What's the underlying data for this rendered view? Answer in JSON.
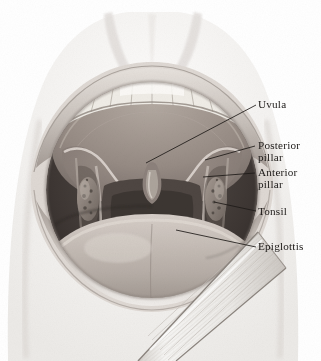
{
  "figure": {
    "type": "anatomical-illustration",
    "style": "grayscale pencil and stipple drawing",
    "background_color": "#ffffff",
    "ink_color": "#1d1a18"
  },
  "labels": [
    {
      "id": "uvula",
      "text": "Uvula",
      "line2": "",
      "x": 258,
      "y": 98,
      "leader": {
        "x1": 256,
        "y1": 105,
        "x2": 146,
        "y2": 163
      }
    },
    {
      "id": "posterior-pillar",
      "text": "Posterior",
      "line2": "pillar",
      "x": 258,
      "y": 139,
      "leader": {
        "x1": 255,
        "y1": 146,
        "x2": 205,
        "y2": 160
      }
    },
    {
      "id": "anterior-pillar",
      "text": "Anterior",
      "line2": "pillar",
      "x": 258,
      "y": 166,
      "leader": {
        "x1": 255,
        "y1": 173,
        "x2": 203,
        "y2": 177
      }
    },
    {
      "id": "tonsil",
      "text": "Tonsil",
      "line2": "",
      "x": 258,
      "y": 205,
      "leader": {
        "x1": 256,
        "y1": 211,
        "x2": 214,
        "y2": 202
      }
    },
    {
      "id": "epiglottis",
      "text": "Epiglottis",
      "line2": "",
      "x": 258,
      "y": 240,
      "leader": {
        "x1": 256,
        "y1": 247,
        "x2": 176,
        "y2": 230
      }
    }
  ],
  "structures": [
    {
      "id": "face",
      "name": "Face and nose",
      "tone": "#f4f2f0"
    },
    {
      "id": "upper-lip",
      "name": "Upper lip",
      "tone": "#cfc9c4"
    },
    {
      "id": "lower-lip",
      "name": "Lower lip",
      "tone": "#c8c2bd"
    },
    {
      "id": "upper-teeth",
      "name": "Upper teeth",
      "tone": "#f2efe9"
    },
    {
      "id": "lower-teeth",
      "name": "Lower teeth",
      "tone": "#e8e4dd"
    },
    {
      "id": "hard-palate",
      "name": "Hard palate",
      "tone": "#9e948c"
    },
    {
      "id": "soft-palate",
      "name": "Soft palate",
      "tone": "#8b807a"
    },
    {
      "id": "uvula",
      "name": "Uvula",
      "tone": "#6f645f"
    },
    {
      "id": "pharynx",
      "name": "Pharyngeal cavity",
      "tone": "#4a423e"
    },
    {
      "id": "tonsil-left",
      "name": "Left tonsil",
      "tone": "#8a8078"
    },
    {
      "id": "tonsil-right",
      "name": "Right tonsil",
      "tone": "#8a8078"
    },
    {
      "id": "tongue",
      "name": "Tongue",
      "tone": "#b3aaa3"
    },
    {
      "id": "tongue-depressor",
      "name": "Tongue depressor blade",
      "tone": "#e9e6e2"
    }
  ]
}
